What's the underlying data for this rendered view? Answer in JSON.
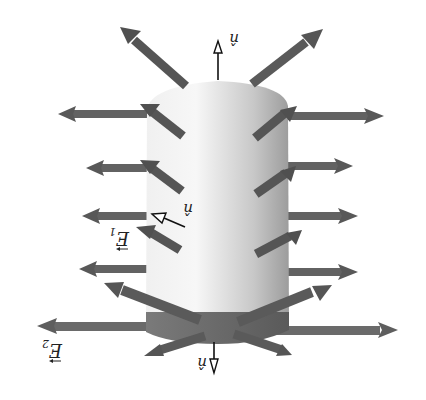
{
  "diagram": {
    "title": "Gaussian cylinder in electric field (image shown rotated 180°)",
    "orientation_deg": 180,
    "colors": {
      "background": "#ffffff",
      "arrow_fill": "#5f5f5f",
      "arrow_dark": "#4a4a4a",
      "cylinder_light": "#f4f4f4",
      "cylinder_dark": "#9a9a9a",
      "cap_dark": "#6a6a6a"
    },
    "labels": {
      "field_1": "E",
      "field_1_sub": "1",
      "field_2": "E",
      "field_2_sub": "2",
      "normal_top": "n̂",
      "normal_side": "n̂",
      "normal_bottom": "n̂"
    },
    "elements": {
      "cylinder": "Gaussian surface (cylinder)",
      "field_arrows_count": 20,
      "normal_vectors_count": 3
    }
  }
}
